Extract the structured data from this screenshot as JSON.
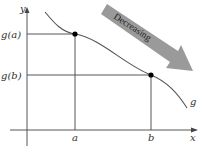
{
  "diagram": {
    "function_label": "g",
    "axes": {
      "x_label": "x",
      "y_label": "y"
    },
    "x_ticks": [
      {
        "label": "a",
        "x": 75
      },
      {
        "label": "b",
        "x": 151
      }
    ],
    "y_ticks": [
      {
        "label": "g(a)",
        "y": 34
      },
      {
        "label": "g(b)",
        "y": 75
      }
    ],
    "arrow_label": "Decreasing",
    "colors": {
      "curve": "#555555",
      "axes": "#444444",
      "arrow_fill": "#9a9a9a",
      "point": "#000000"
    }
  }
}
